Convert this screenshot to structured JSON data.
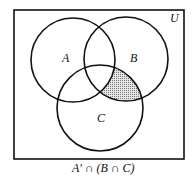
{
  "diagram": {
    "type": "venn",
    "universe_label": "U",
    "sets": [
      {
        "label": "A"
      },
      {
        "label": "B"
      },
      {
        "label": "C"
      }
    ],
    "shaded_region": "A' ∩ (B ∩ C)",
    "caption": "A′ ∩ (B ∩ C)",
    "colors": {
      "stroke": "#111111",
      "shade": "#bdbdbd",
      "background": "#ffffff"
    }
  }
}
